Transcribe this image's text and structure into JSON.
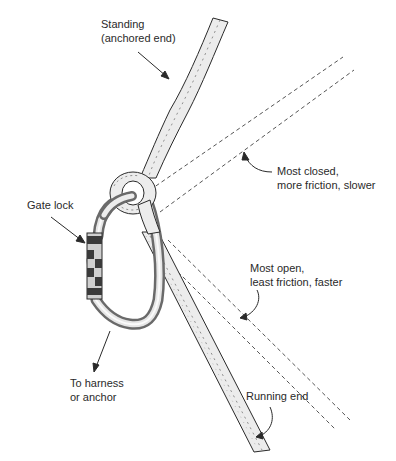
{
  "diagram": {
    "colors": {
      "ink": "#2a2a2a",
      "rope_fill": "#ececec",
      "metal_fill": "#d4d4d4",
      "metal_highlight": "#f4f4f4",
      "gate_dark": "#3a3a3a"
    },
    "labels": {
      "standing": {
        "line1": "Standing",
        "line2": "(anchored end)"
      },
      "gate_lock": {
        "line1": "Gate lock"
      },
      "most_closed": {
        "line1": "Most closed,",
        "line2": "more friction, slower"
      },
      "most_open": {
        "line1": "Most open,",
        "line2": "least friction, faster"
      },
      "harness": {
        "line1": "To harness",
        "line2": "or anchor"
      },
      "running_end": {
        "line1": "Running end"
      }
    },
    "elements": [
      "standing-rope",
      "knot",
      "carabiner",
      "gate-lock-sleeve",
      "running-rope",
      "dashed-path-most-closed",
      "dashed-path-most-open"
    ]
  }
}
